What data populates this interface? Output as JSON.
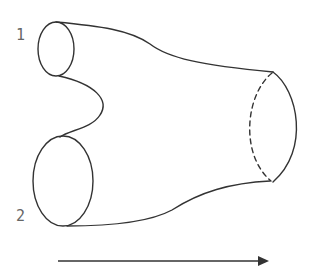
{
  "diagram": {
    "labels": {
      "inlet_1": "1",
      "inlet_2": "2"
    },
    "flow_direction": "left-to-right",
    "colors": {
      "stroke": "#333333",
      "label": "#666666",
      "background": "#ffffff"
    }
  }
}
